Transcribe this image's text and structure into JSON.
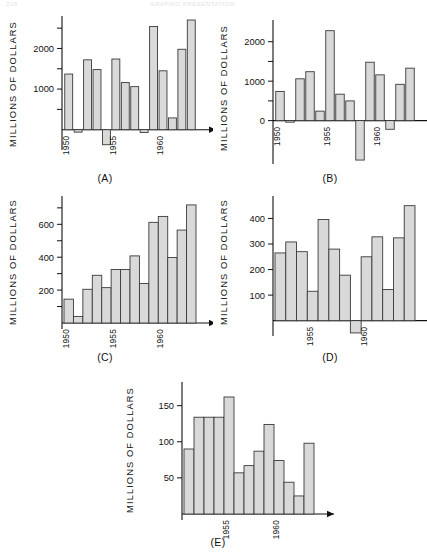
{
  "header": {
    "left": "228",
    "center": "GRAPHIC PRESENTATION"
  },
  "axis_label": "MILLIONS OF DOLLARS",
  "captions": {
    "a": "(A)",
    "b": "(B)",
    "c": "(C)",
    "d": "(D)",
    "e": "(E)"
  },
  "chart_data": [
    {
      "id": "A",
      "type": "bar",
      "title": "(A)",
      "xlabel": "",
      "ylabel": "MILLIONS OF DOLLARS",
      "ylim": [
        -500,
        2750
      ],
      "ytick_labels": [
        "1000",
        "2000"
      ],
      "ytick_values": [
        1000,
        2000
      ],
      "yticks_minor": [
        500,
        1500,
        2500
      ],
      "grid": false,
      "legend": "none",
      "x": [
        1950,
        1951,
        1952,
        1953,
        1954,
        1955,
        1956,
        1957,
        1958,
        1959,
        1960,
        1961,
        1962,
        1963
      ],
      "xtick_labels": [
        "1950",
        "1955",
        "1960"
      ],
      "xtick_values": [
        1950,
        1955,
        1960
      ],
      "values": [
        1370,
        -60,
        1720,
        1480,
        -370,
        1740,
        1160,
        1060,
        -70,
        2540,
        1450,
        290,
        1980,
        2700
      ]
    },
    {
      "id": "B",
      "type": "bar",
      "title": "(B)",
      "xlabel": "",
      "ylabel": "MILLIONS OF DOLLARS",
      "ylim": [
        -1100,
        2500
      ],
      "ytick_labels": [
        "0",
        "1000",
        "2000"
      ],
      "ytick_values": [
        0,
        1000,
        2000
      ],
      "yticks_minor": [
        500,
        1500
      ],
      "grid": false,
      "legend": "none",
      "x": [
        1950,
        1951,
        1952,
        1953,
        1954,
        1955,
        1956,
        1957,
        1958,
        1959,
        1960,
        1961,
        1962,
        1963
      ],
      "xtick_labels": [
        "1950",
        "1955",
        "1960"
      ],
      "xtick_values": [
        1950,
        1955,
        1960
      ],
      "values": [
        740,
        -40,
        1060,
        1240,
        240,
        2280,
        670,
        500,
        -1000,
        1480,
        1160,
        -220,
        920,
        1330
      ]
    },
    {
      "id": "C",
      "type": "bar",
      "title": "(C)",
      "xlabel": "",
      "ylabel": "MILLIONS OF DOLLARS",
      "ylim": [
        0,
        760
      ],
      "ytick_labels": [
        "200",
        "400",
        "600"
      ],
      "ytick_values": [
        200,
        400,
        600
      ],
      "yticks_minor": [
        100,
        300,
        500,
        700
      ],
      "grid": false,
      "legend": "none",
      "x": [
        1950,
        1951,
        1952,
        1953,
        1954,
        1955,
        1956,
        1957,
        1958,
        1959,
        1960,
        1961,
        1962,
        1963
      ],
      "xtick_labels": [
        "1950",
        "1955",
        "1960"
      ],
      "xtick_values": [
        1950,
        1955,
        1960
      ],
      "values": [
        145,
        40,
        205,
        290,
        215,
        325,
        325,
        408,
        240,
        612,
        648,
        398,
        565,
        718
      ]
    },
    {
      "id": "D",
      "type": "bar",
      "title": "(D)",
      "xlabel": "",
      "ylabel": "MILLIONS OF DOLLARS",
      "ylim": [
        -60,
        480
      ],
      "ytick_labels": [
        "100",
        "200",
        "300",
        "400"
      ],
      "ytick_values": [
        100,
        200,
        300,
        400
      ],
      "yticks_minor": [],
      "grid": false,
      "legend": "none",
      "x": [
        1952,
        1953,
        1954,
        1955,
        1956,
        1957,
        1958,
        1959,
        1960,
        1961,
        1962,
        1963
      ],
      "xtick_labels": [
        "1955",
        "1960"
      ],
      "xtick_values": [
        1955,
        1960
      ],
      "values": [
        265,
        308,
        270,
        115,
        396,
        280,
        178,
        -48,
        250,
        328,
        122,
        324,
        450
      ]
    },
    {
      "id": "E",
      "type": "bar",
      "title": "(E)",
      "xlabel": "",
      "ylabel": "MILLIONS OF DOLLARS",
      "ylim": [
        0,
        180
      ],
      "ytick_labels": [
        "50",
        "100",
        "150"
      ],
      "ytick_values": [
        50,
        100,
        150
      ],
      "yticks_minor": [],
      "grid": false,
      "legend": "none",
      "x": [
        1951,
        1952,
        1953,
        1954,
        1955,
        1956,
        1957,
        1958,
        1959,
        1960,
        1961,
        1962,
        1963
      ],
      "xtick_labels": [
        "1955",
        "1960"
      ],
      "xtick_values": [
        1955,
        1960
      ],
      "values": [
        90,
        134,
        134,
        134,
        162,
        57,
        67,
        87,
        124,
        74,
        44,
        25,
        98
      ]
    }
  ]
}
